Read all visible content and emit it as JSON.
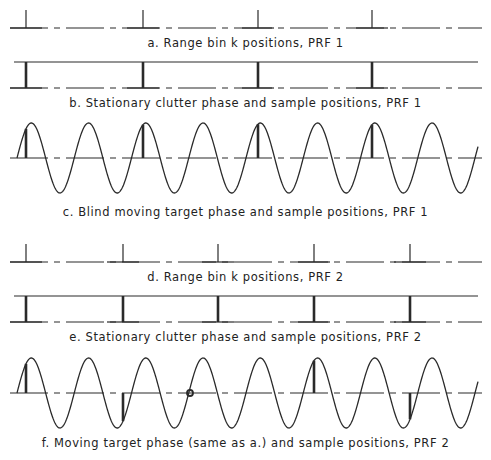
{
  "panels": [
    {
      "id": "a",
      "kind": "ticks",
      "caption": "a.  Range bin k positions,  PRF 1",
      "baseline_y": 28,
      "tick_x": [
        26,
        143,
        258,
        372
      ]
    },
    {
      "id": "b",
      "kind": "clutter",
      "caption": "b.  Stationary clutter phase and sample positions,  PRF 1",
      "top_y": 62,
      "bottom_y": 88,
      "tick_x": [
        26,
        143,
        258,
        372
      ]
    },
    {
      "id": "c",
      "kind": "sine",
      "caption": "c.  Blind moving target phase and sample positions,  PRF 1",
      "center_y": 158,
      "amplitude": 35,
      "period": 57.25,
      "start_x": 17,
      "end_x": 478,
      "samples": [
        {
          "x": 26,
          "dir": "up"
        },
        {
          "x": 143,
          "dir": "up"
        },
        {
          "x": 258,
          "dir": "up"
        },
        {
          "x": 372,
          "dir": "up"
        }
      ]
    },
    {
      "id": "d",
      "kind": "ticks",
      "caption": "d.  Range bin k positions,  PRF 2",
      "baseline_y": 262,
      "tick_x": [
        26,
        123,
        218,
        314,
        410
      ]
    },
    {
      "id": "e",
      "kind": "clutter",
      "caption": "e.  Stationary clutter phase and sample positions,  PRF 2",
      "top_y": 296,
      "bottom_y": 322,
      "tick_x": [
        26,
        123,
        218,
        314,
        410
      ]
    },
    {
      "id": "f",
      "kind": "sine",
      "caption": "f.  Moving target phase (same as a.) and sample positions,  PRF 2",
      "center_y": 393,
      "amplitude": 35,
      "period": 57.25,
      "start_x": 17,
      "end_x": 478,
      "samples": [
        {
          "x": 26,
          "dir": "up"
        },
        {
          "x": 123,
          "dir": "down"
        },
        {
          "x": 190,
          "dir": "zero"
        },
        {
          "x": 314,
          "dir": "up"
        },
        {
          "x": 410,
          "dir": "down"
        }
      ]
    }
  ],
  "caption_y": [
    36,
    96,
    205,
    270,
    330,
    436
  ],
  "colors": {
    "line": "#2a2a2a",
    "text": "#222222",
    "background": "#ffffff"
  }
}
